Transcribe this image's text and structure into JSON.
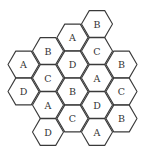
{
  "diagram": {
    "type": "hexagonal-cell-grid",
    "columns": [
      {
        "cells": [
          "A",
          "D"
        ]
      },
      {
        "cells": [
          "B",
          "C",
          "A",
          "D"
        ]
      },
      {
        "cells": [
          "A",
          "D",
          "B",
          "C"
        ]
      },
      {
        "cells": [
          "B",
          "C",
          "A",
          "D",
          "A"
        ]
      },
      {
        "cells": [
          "B",
          "C",
          "B"
        ]
      }
    ],
    "colors": {
      "stroke": "#3a3a3a",
      "fill": "#ffffff",
      "text": "#333333"
    }
  }
}
